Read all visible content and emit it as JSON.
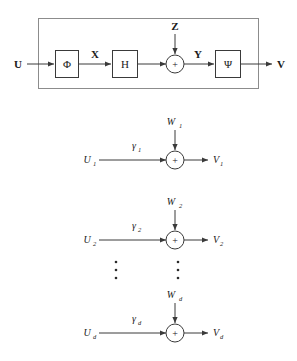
{
  "figure": {
    "top_block": {
      "input_label": "U",
      "output_label": "V",
      "noise_label": "Z",
      "intermediate_label_1": "X",
      "intermediate_label_2": "Y",
      "blocks": [
        {
          "name": "phi-block",
          "label": "Φ"
        },
        {
          "name": "h-block",
          "label": "H"
        },
        {
          "name": "psi-block",
          "label": "Ψ"
        }
      ],
      "sum_symbol": "+"
    },
    "channels": [
      {
        "input_label": "U",
        "input_sub": "1",
        "gain_label": "γ",
        "gain_sub": "1",
        "noise_label": "W",
        "noise_sub": "1",
        "output_label": "V",
        "output_sub": "1",
        "sum_symbol": "+"
      },
      {
        "input_label": "U",
        "input_sub": "2",
        "gain_label": "γ",
        "gain_sub": "2",
        "noise_label": "W",
        "noise_sub": "2",
        "output_label": "V",
        "output_sub": "2",
        "sum_symbol": "+"
      },
      {
        "input_label": "U",
        "input_sub": "d",
        "gain_label": "γ",
        "gain_sub": "d",
        "noise_label": "W",
        "noise_sub": "d",
        "output_label": "V",
        "output_sub": "d",
        "sum_symbol": "+"
      }
    ],
    "ellipsis": {
      "left_column_label": "vertical-dots",
      "right_column_label": "vertical-dots"
    },
    "colors": {
      "stroke": "#3a3a3a",
      "outer_stroke": "#8c8c8c",
      "text": "#1a1a1a",
      "background": "#ffffff"
    }
  }
}
